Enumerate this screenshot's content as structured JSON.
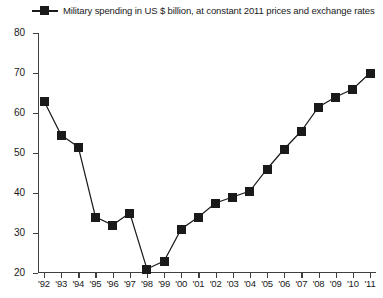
{
  "legend": {
    "label": "Military spending in US $ billion, at constant 2011 prices and exchange rates",
    "marker_icon": "filled-square-marker",
    "color": "#1a1a1a"
  },
  "axes": {
    "y_ticks": [
      "80",
      "70",
      "60",
      "50",
      "40",
      "30",
      "20"
    ],
    "x_ticks": [
      "'92",
      "'93",
      "'94",
      "'95",
      "'96",
      "'97",
      "'98",
      "'99",
      "'00",
      "'01",
      "'02",
      "'03",
      "'04",
      "'05",
      "'06",
      "'07",
      "'08",
      "'09",
      "'10",
      "'11"
    ]
  },
  "chart_data": {
    "type": "line",
    "title": "",
    "subtitle": "",
    "xlabel": "",
    "ylabel": "",
    "ylim": [
      20,
      80
    ],
    "ytick_values": [
      80,
      70,
      60,
      50,
      40,
      30,
      20
    ],
    "grid": false,
    "legend_position": "top-left",
    "marker": "square",
    "color": "#1a1a1a",
    "categories": [
      "'92",
      "'93",
      "'94",
      "'95",
      "'96",
      "'97",
      "'98",
      "'99",
      "'00",
      "'01",
      "'02",
      "'03",
      "'04",
      "'05",
      "'06",
      "'07",
      "'08",
      "'09",
      "'10",
      "'11"
    ],
    "series": [
      {
        "name": "Military spending in US $ billion, at constant 2011 prices and exchange rates",
        "values": [
          63,
          54.5,
          51.5,
          34,
          32,
          35,
          21,
          23,
          31,
          34,
          37.5,
          39,
          40.5,
          46,
          51,
          55.5,
          61.5,
          64,
          66,
          70
        ]
      }
    ]
  }
}
